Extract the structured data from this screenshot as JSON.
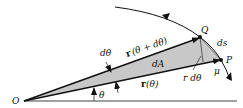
{
  "diagram": {
    "colors": {
      "stroke": "#111111",
      "shaded_region": "#c8c8c8",
      "background": "#ffffff"
    },
    "labels": {
      "origin": "O",
      "point_q": "Q",
      "point_p": "P",
      "d_theta": "dθ",
      "r_theta_plus": "(θ + dθ)",
      "r_theta": "(θ)",
      "r_bold": "r",
      "dA": "dA",
      "ds": "ds",
      "r_dtheta": "r dθ",
      "mu": "μ",
      "theta": "θ"
    }
  }
}
